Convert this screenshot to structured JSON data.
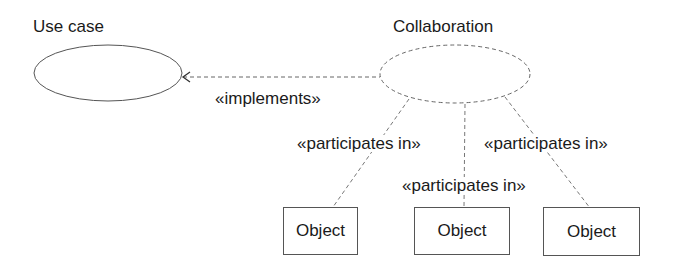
{
  "diagram": {
    "use_case": {
      "title": "Use case"
    },
    "collaboration": {
      "title": "Collaboration"
    },
    "implements_label": "«implements»",
    "participates": [
      {
        "label": "«participates in»"
      },
      {
        "label": "«participates in»"
      },
      {
        "label": "«participates in»"
      }
    ],
    "objects": [
      {
        "label": "Object"
      },
      {
        "label": "Object"
      },
      {
        "label": "Object"
      }
    ],
    "colors": {
      "stroke": "#555555",
      "text": "#1a1a1a"
    }
  }
}
